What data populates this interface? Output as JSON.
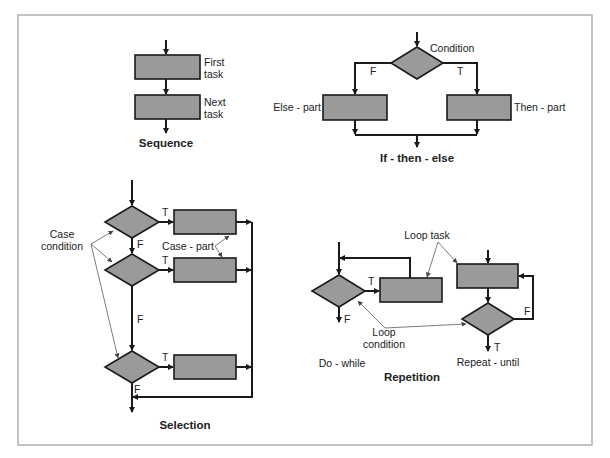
{
  "sequence": {
    "title": "Sequence",
    "first_task": [
      "First",
      "task"
    ],
    "next_task": [
      "Next",
      "task"
    ]
  },
  "if_then_else": {
    "title": "If - then - else",
    "condition": "Condition",
    "false_label": "F",
    "true_label": "T",
    "else_part": "Else - part",
    "then_part": "Then - part"
  },
  "selection": {
    "title": "Selection",
    "case_condition": [
      "Case",
      "condition"
    ],
    "case_part": "Case - part",
    "true_label": "T",
    "false_label": "F"
  },
  "repetition": {
    "title": "Repetition",
    "loop_task": "Loop task",
    "loop_condition": [
      "Loop",
      "condition"
    ],
    "do_while": "Do - while",
    "repeat_until": "Repeat - until",
    "true_label": "T",
    "false_label": "F"
  },
  "colors": {
    "shape_fill": "#9a9a9a",
    "stroke": "#1a1a1a",
    "frame": "#9a9a9a"
  }
}
